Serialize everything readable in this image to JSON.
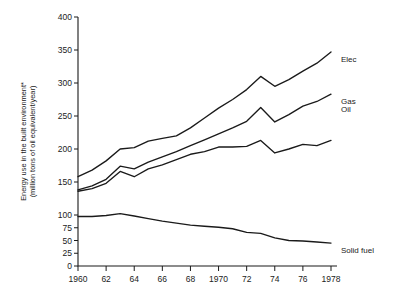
{
  "chart_data": {
    "type": "line",
    "title": "",
    "xlabel": "",
    "ylabel": "Energy use in the built environment*\n(million tons of oil equivalent/year)",
    "ylabel_line1": "Energy use in the built environment*",
    "ylabel_line2": "(million tons of oil equivalent/year)",
    "x": [
      1960,
      1961,
      1962,
      1963,
      1964,
      1965,
      1966,
      1967,
      1968,
      1969,
      1970,
      1971,
      1972,
      1973,
      1974,
      1975,
      1976,
      1977,
      1978
    ],
    "xtick_labels": [
      "1960",
      "62",
      "64",
      "66",
      "68",
      "1970",
      "72",
      "74",
      "76",
      "1978"
    ],
    "xtick_values": [
      1960,
      1962,
      1964,
      1966,
      1968,
      1970,
      1972,
      1974,
      1976,
      1978
    ],
    "ytick_labels": [
      "400",
      "350",
      "300",
      "250",
      "200",
      "150",
      "100",
      "75",
      "50",
      "25",
      "0"
    ],
    "ytick_values": [
      400,
      350,
      300,
      250,
      200,
      150,
      100,
      75,
      50,
      25,
      0
    ],
    "ylim": [
      0,
      400
    ],
    "y_axis_note": "Scale is compressed below 100 (ticks at 100, 75, 50, 25, 0)",
    "grid": false,
    "legend_position": "right-inline",
    "series": [
      {
        "name": "Elec",
        "label": "Elec",
        "values": [
          158,
          168,
          182,
          200,
          202,
          212,
          216,
          220,
          232,
          247,
          262,
          275,
          290,
          310,
          295,
          305,
          318,
          330,
          347
        ]
      },
      {
        "name": "Gas",
        "label": "Gas",
        "values": [
          138,
          144,
          154,
          174,
          170,
          180,
          188,
          196,
          205,
          214,
          223,
          232,
          242,
          263,
          241,
          252,
          265,
          272,
          283
        ]
      },
      {
        "name": "Oil",
        "label": "Oil",
        "values": [
          136,
          140,
          148,
          166,
          158,
          170,
          176,
          184,
          192,
          196,
          203,
          203,
          204,
          213,
          194,
          200,
          207,
          205,
          213
        ]
      },
      {
        "name": "Solid fuel",
        "label": "Solid fuel",
        "values": [
          97,
          97,
          99,
          102,
          98,
          93,
          88,
          84,
          80,
          78,
          76,
          73,
          66,
          64,
          55,
          50,
          49,
          47,
          45
        ]
      }
    ]
  },
  "series_labels": {
    "elec": "Elec",
    "gas": "Gas",
    "oil": "Oil",
    "solid_fuel": "Solid fuel"
  },
  "colors": {
    "line": "#1a1a1a",
    "axis": "#1a1a1a",
    "background": "#ffffff"
  }
}
